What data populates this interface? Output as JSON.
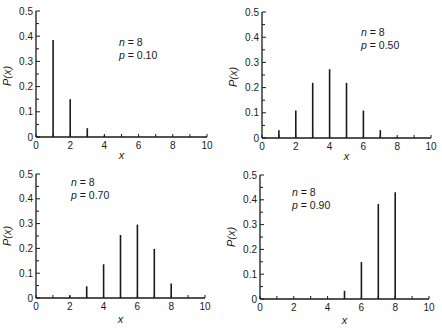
{
  "figure": {
    "ink_color": "#1a1a1a",
    "background": "#ffffff"
  },
  "chart_data": [
    {
      "type": "bar",
      "position": "top-left",
      "title": "",
      "annotation": {
        "n_label": "n",
        "n_value": "= 8",
        "p_label": "p",
        "p_value": "= 0.10"
      },
      "xlabel": "x",
      "ylabel": "P(x)",
      "xlim": [
        0,
        10
      ],
      "ylim": [
        0,
        0.5
      ],
      "xticks": [
        "0",
        "2",
        "4",
        "6",
        "8",
        "10"
      ],
      "yticks": [
        "0",
        "0.1",
        "0.2",
        "0.3",
        "0.4",
        "0.5"
      ],
      "grid": false,
      "legend": "none",
      "x": [
        1,
        2,
        3,
        4
      ],
      "values": [
        0.385,
        0.15,
        0.035,
        0.006
      ]
    },
    {
      "type": "bar",
      "position": "top-right",
      "title": "",
      "annotation": {
        "n_label": "n",
        "n_value": "= 8",
        "p_label": "p",
        "p_value": "= 0.50"
      },
      "xlabel": "x",
      "ylabel": "P(x)",
      "xlim": [
        0,
        10
      ],
      "ylim": [
        0,
        0.5
      ],
      "xticks": [
        "0",
        "2",
        "4",
        "6",
        "8",
        "10"
      ],
      "yticks": [
        "0",
        "0.1",
        "0.2",
        "0.3",
        "0.4",
        "0.5"
      ],
      "grid": false,
      "legend": "none",
      "x": [
        1,
        2,
        3,
        4,
        5,
        6,
        7,
        8
      ],
      "values": [
        0.031,
        0.109,
        0.219,
        0.273,
        0.219,
        0.109,
        0.031,
        0.004
      ]
    },
    {
      "type": "bar",
      "position": "bottom-left",
      "title": "",
      "annotation": {
        "n_label": "n",
        "n_value": "= 8",
        "p_label": "p",
        "p_value": "= 0.70"
      },
      "xlabel": "x",
      "ylabel": "P(x)",
      "xlim": [
        0,
        10
      ],
      "ylim": [
        0,
        0.5
      ],
      "xticks": [
        "0",
        "2",
        "4",
        "6",
        "8",
        "10"
      ],
      "yticks": [
        "0",
        "0.1",
        "0.2",
        "0.3",
        "0.4",
        "0.5"
      ],
      "grid": false,
      "legend": "none",
      "x": [
        2,
        3,
        4,
        5,
        6,
        7,
        8
      ],
      "values": [
        0.01,
        0.047,
        0.136,
        0.254,
        0.296,
        0.198,
        0.058
      ]
    },
    {
      "type": "bar",
      "position": "bottom-right",
      "title": "",
      "annotation": {
        "n_label": "n",
        "n_value": "= 8",
        "p_label": "p",
        "p_value": "= 0.90"
      },
      "xlabel": "x",
      "ylabel": "P(x)",
      "xlim": [
        0,
        10
      ],
      "ylim": [
        0,
        0.5
      ],
      "xticks": [
        "0",
        "2",
        "4",
        "6",
        "8",
        "10"
      ],
      "yticks": [
        "0",
        "0.1",
        "0.2",
        "0.3",
        "0.4",
        "0.5"
      ],
      "grid": false,
      "legend": "none",
      "x": [
        5,
        6,
        7,
        8
      ],
      "values": [
        0.033,
        0.149,
        0.383,
        0.43
      ]
    }
  ],
  "layout": {
    "panels": [
      {
        "ox": 36,
        "oy": 137,
        "xend": 207,
        "ytop": 11,
        "ann_x": 119,
        "ann_y1": 46,
        "ann_y2": 59,
        "ylabel_x": 11,
        "ylabel_y": 76,
        "xlabel_y": 159
      },
      {
        "ox": 262,
        "oy": 138,
        "xend": 431,
        "ytop": 12,
        "ann_x": 361,
        "ann_y1": 36,
        "ann_y2": 49,
        "ylabel_x": 237,
        "ylabel_y": 77,
        "xlabel_y": 160
      },
      {
        "ox": 36,
        "oy": 298,
        "xend": 205,
        "ytop": 174,
        "ann_x": 71,
        "ann_y1": 186,
        "ann_y2": 199,
        "ylabel_x": 11,
        "ylabel_y": 236,
        "xlabel_y": 323
      },
      {
        "ox": 260,
        "oy": 299,
        "xend": 429,
        "ytop": 175,
        "ann_x": 292,
        "ann_y1": 196,
        "ann_y2": 209,
        "ylabel_x": 235,
        "ylabel_y": 237,
        "xlabel_y": 324
      }
    ]
  }
}
